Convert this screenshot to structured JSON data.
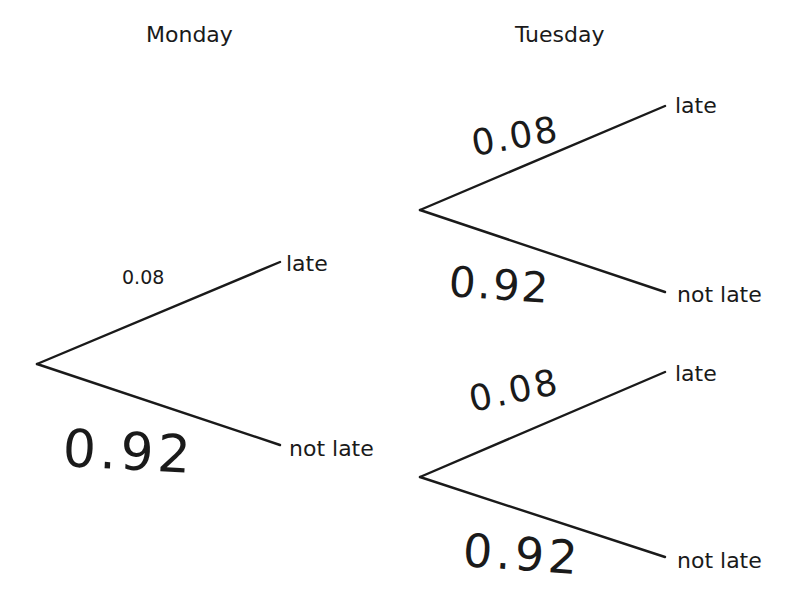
{
  "diagram": {
    "type": "probability tree",
    "headers": {
      "monday": "Monday",
      "tuesday": "Tuesday"
    },
    "monday": {
      "branches": [
        {
          "outcome": "late",
          "probability": "0.08",
          "style": "printed"
        },
        {
          "outcome": "not late",
          "probability": "0.92",
          "style": "handwritten"
        }
      ]
    },
    "tuesday_after_late": {
      "branches": [
        {
          "outcome": "late",
          "probability": "0.08",
          "style": "handwritten"
        },
        {
          "outcome": "not late",
          "probability": "0.92",
          "style": "handwritten"
        }
      ]
    },
    "tuesday_after_not_late": {
      "branches": [
        {
          "outcome": "late",
          "probability": "0.08",
          "style": "handwritten"
        },
        {
          "outcome": "not late",
          "probability": "0.92",
          "style": "handwritten"
        }
      ]
    }
  }
}
